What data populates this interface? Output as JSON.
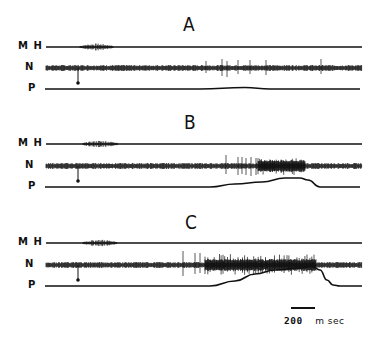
{
  "figure": {
    "panels": [
      {
        "letter": "A",
        "letter_pos": [
          189,
          14
        ],
        "traces": {
          "MH": {
            "label": "M H",
            "y": 47
          },
          "N": {
            "label": "N",
            "y": 68
          },
          "P": {
            "label": "P",
            "y": 89
          }
        },
        "mh_burst": [
          80,
          113
        ],
        "stimulus_x": 78,
        "n_noise_amp": 2.5,
        "n_spikes": [
          [
            206,
            7,
            5
          ],
          [
            222,
            9,
            8
          ],
          [
            227,
            7,
            9
          ],
          [
            238,
            8,
            6
          ],
          [
            250,
            8,
            6
          ],
          [
            266,
            8,
            7
          ],
          [
            321,
            9,
            6
          ]
        ],
        "n_burst": null,
        "p_curve": [
          [
            45,
            89
          ],
          [
            200,
            89
          ],
          [
            245,
            87.5
          ],
          [
            270,
            89
          ],
          [
            360,
            89
          ]
        ]
      },
      {
        "letter": "B",
        "letter_pos": [
          189,
          112
        ],
        "traces": {
          "MH": {
            "label": "M H",
            "y": 144
          },
          "N": {
            "label": "N",
            "y": 166
          },
          "P": {
            "label": "P",
            "y": 187
          }
        },
        "mh_burst": [
          83,
          118
        ],
        "stimulus_x": 78,
        "n_noise_amp": 2.5,
        "n_spikes": [
          [
            226,
            11,
            8
          ],
          [
            238,
            9,
            9
          ],
          [
            242,
            9,
            8
          ],
          [
            246,
            8,
            9
          ],
          [
            251,
            9,
            10
          ],
          [
            256,
            8,
            9
          ]
        ],
        "n_burst": [
          258,
          305,
          8,
          9
        ],
        "p_curve": [
          [
            45,
            187
          ],
          [
            210,
            187
          ],
          [
            235,
            184
          ],
          [
            262,
            182
          ],
          [
            285,
            178
          ],
          [
            300,
            178
          ],
          [
            308,
            180
          ],
          [
            320,
            187
          ],
          [
            360,
            187
          ]
        ]
      },
      {
        "letter": "C",
        "letter_pos": [
          189,
          212
        ],
        "traces": {
          "MH": {
            "label": "M H",
            "y": 243
          },
          "N": {
            "label": "N",
            "y": 265
          },
          "P": {
            "label": "P",
            "y": 286
          }
        },
        "mh_burst": [
          83,
          117
        ],
        "stimulus_x": 78,
        "n_noise_amp": 2.5,
        "n_spikes": [
          [
            183,
            14,
            11
          ],
          [
            195,
            12,
            9
          ],
          [
            200,
            12,
            8
          ]
        ],
        "n_burst": [
          205,
          316,
          11,
          10
        ],
        "p_curve": [
          [
            45,
            286
          ],
          [
            210,
            286
          ],
          [
            235,
            281
          ],
          [
            255,
            274
          ],
          [
            275,
            270
          ],
          [
            300,
            268
          ],
          [
            312,
            266
          ],
          [
            320,
            270
          ],
          [
            327,
            280
          ],
          [
            333,
            285
          ],
          [
            340,
            286
          ],
          [
            362,
            286
          ]
        ]
      }
    ],
    "trace_x_range": [
      46,
      362
    ],
    "scale_bar": {
      "x1": 291,
      "x2": 315,
      "y": 308,
      "label_value": "200",
      "label_unit": "m sec"
    }
  }
}
